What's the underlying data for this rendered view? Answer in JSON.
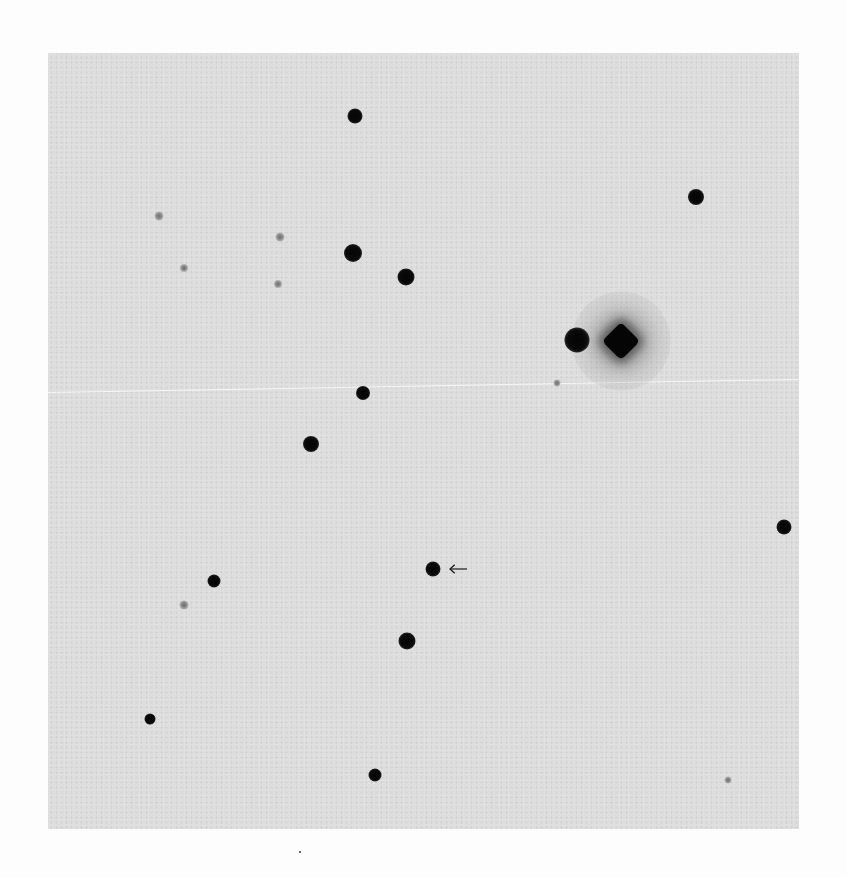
{
  "figure": {
    "type": "finding-chart",
    "colors": {
      "page_background": "#fdfdfd",
      "plate_background": "#dcdcdc",
      "star": "#050505"
    },
    "plate_bounds": {
      "left": 48,
      "top": 53,
      "width": 751,
      "height": 776
    },
    "target": {
      "marker": "arrow",
      "x": 433,
      "y": 569,
      "arrow_tip_x": 449,
      "arrow_tail_x": 468,
      "direction": "pointing-left"
    },
    "bright_star": {
      "shape": "diamond",
      "x": 621,
      "y": 341,
      "size": 38
    },
    "stars": [
      {
        "x": 355,
        "y": 116,
        "d": 15,
        "kind": "bright"
      },
      {
        "x": 696,
        "y": 197,
        "d": 16,
        "kind": "bright"
      },
      {
        "x": 159,
        "y": 216,
        "d": 9,
        "kind": "faint"
      },
      {
        "x": 280,
        "y": 237,
        "d": 9,
        "kind": "faint"
      },
      {
        "x": 353,
        "y": 253,
        "d": 18,
        "kind": "bright"
      },
      {
        "x": 184,
        "y": 268,
        "d": 8,
        "kind": "faint"
      },
      {
        "x": 406,
        "y": 277,
        "d": 17,
        "kind": "bright"
      },
      {
        "x": 278,
        "y": 284,
        "d": 8,
        "kind": "faint"
      },
      {
        "x": 577,
        "y": 340,
        "d": 25,
        "kind": "bright"
      },
      {
        "x": 557,
        "y": 383,
        "d": 7,
        "kind": "faint"
      },
      {
        "x": 363,
        "y": 393,
        "d": 14,
        "kind": "bright"
      },
      {
        "x": 311,
        "y": 444,
        "d": 16,
        "kind": "bright"
      },
      {
        "x": 784,
        "y": 527,
        "d": 15,
        "kind": "bright"
      },
      {
        "x": 433,
        "y": 569,
        "d": 15,
        "kind": "bright"
      },
      {
        "x": 214,
        "y": 581,
        "d": 13,
        "kind": "bright"
      },
      {
        "x": 184,
        "y": 605,
        "d": 9,
        "kind": "faint"
      },
      {
        "x": 407,
        "y": 641,
        "d": 17,
        "kind": "bright"
      },
      {
        "x": 150,
        "y": 719,
        "d": 11,
        "kind": "bright"
      },
      {
        "x": 375,
        "y": 775,
        "d": 13,
        "kind": "bright"
      },
      {
        "x": 728,
        "y": 780,
        "d": 7,
        "kind": "faint"
      }
    ],
    "scratch": {
      "x1": 48,
      "y1": 392,
      "x2": 799,
      "y2": 379
    },
    "specks": [
      {
        "x": 299,
        "y": 851
      }
    ]
  }
}
